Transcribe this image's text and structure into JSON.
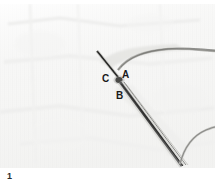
{
  "figure": {
    "number": "1",
    "kind": "black-and-white photograph",
    "background_color": "#f7f7f6",
    "ink_color": "#1a1a1a",
    "plate": {
      "x": 0,
      "y": 4,
      "width": 215,
      "height": 164
    },
    "labels": [
      {
        "id": "a",
        "text": "A",
        "x": 122,
        "y": 66
      },
      {
        "id": "b",
        "text": "B",
        "x": 116,
        "y": 87
      },
      {
        "id": "c",
        "text": "C",
        "x": 102,
        "y": 70
      }
    ],
    "features": {
      "knot_point": "convergence of two dark strands forming a V just above labels A and C",
      "upper_thread": "thin thread running from knot toward the upper-right edge",
      "instrument": "straight needle / needle-holder running from point B down to the lower right",
      "lower_thread": "thread curving up to the right from the needle tip"
    }
  }
}
